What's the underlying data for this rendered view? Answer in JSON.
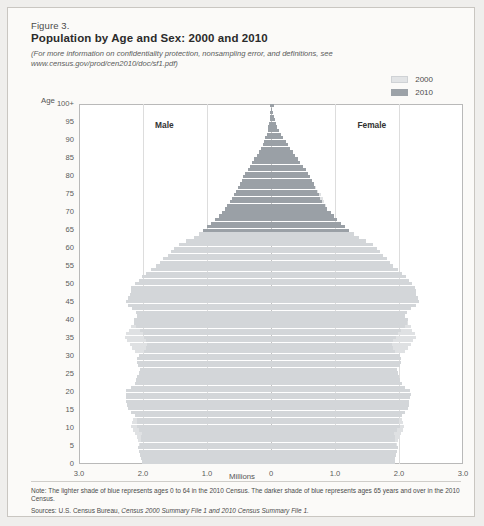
{
  "figure": {
    "number": "Figure 3.",
    "title": "Population by Age and Sex: 2000 and 2010",
    "subtitle_line1": "(For more information on confidentiality protection, nonsampling error, and definitions, see",
    "subtitle_line2": "www.census.gov/prod/cen2010/doc/sf1.pdf)"
  },
  "legend": {
    "items": [
      {
        "label": "2000",
        "color": "#e2e4e6"
      },
      {
        "label": "2010",
        "color": "#9ca2a8"
      }
    ]
  },
  "labels": {
    "age_axis": "Age",
    "x_axis": "Millions",
    "male": "Male",
    "female": "Female"
  },
  "notes": {
    "note": "Note: The lighter shade of blue represents ages 0 to 64 in the 2010 Census. The darker shade of blue represents ages 65 years and over in the 2010 Census.",
    "sources_prefix": "Sources: U.S. Census Bureau, ",
    "sources_italic": "Census 2000 Summary File 1 and 2010 Census Summary File 1."
  },
  "chart_data": {
    "type": "bar",
    "subtype": "population-pyramid",
    "title": "Population by Age and Sex: 2000 and 2010",
    "xlabel": "Millions",
    "ylabel": "Age",
    "xlim": [
      -3.0,
      3.0
    ],
    "ylim": [
      0,
      100
    ],
    "xtick_labels": [
      "3.0",
      "2.0",
      "1.0",
      "0",
      "1.0",
      "2.0",
      "3.0"
    ],
    "xtick_values": [
      -3.0,
      -2.0,
      -1.0,
      0,
      1.0,
      2.0,
      3.0
    ],
    "ytick_labels": [
      "100+",
      "95",
      "90",
      "85",
      "80",
      "75",
      "70",
      "65",
      "60",
      "55",
      "50",
      "45",
      "40",
      "35",
      "30",
      "25",
      "20",
      "15",
      "10",
      "5",
      "0"
    ],
    "ytick_values": [
      100,
      95,
      90,
      85,
      80,
      75,
      70,
      65,
      60,
      55,
      50,
      45,
      40,
      35,
      30,
      25,
      20,
      15,
      10,
      5,
      0
    ],
    "grid": true,
    "legend_position": "top-right",
    "dark_shade_threshold_age": 65,
    "ages": [
      0,
      1,
      2,
      3,
      4,
      5,
      6,
      7,
      8,
      9,
      10,
      11,
      12,
      13,
      14,
      15,
      16,
      17,
      18,
      19,
      20,
      21,
      22,
      23,
      24,
      25,
      26,
      27,
      28,
      29,
      30,
      31,
      32,
      33,
      34,
      35,
      36,
      37,
      38,
      39,
      40,
      41,
      42,
      43,
      44,
      45,
      46,
      47,
      48,
      49,
      50,
      51,
      52,
      53,
      54,
      55,
      56,
      57,
      58,
      59,
      60,
      61,
      62,
      63,
      64,
      65,
      66,
      67,
      68,
      69,
      70,
      71,
      72,
      73,
      74,
      75,
      76,
      77,
      78,
      79,
      80,
      81,
      82,
      83,
      84,
      85,
      86,
      87,
      88,
      89,
      90,
      91,
      92,
      93,
      94,
      95,
      96,
      97,
      98,
      99,
      100
    ],
    "series": [
      {
        "name": "Male 2010",
        "side": "left",
        "values": [
          2.02,
          2.03,
          2.04,
          2.06,
          2.08,
          2.05,
          2.03,
          2.03,
          2.01,
          2.06,
          2.1,
          2.09,
          2.09,
          2.13,
          2.19,
          2.24,
          2.25,
          2.26,
          2.27,
          2.27,
          2.26,
          2.18,
          2.13,
          2.11,
          2.09,
          2.06,
          2.04,
          2.08,
          2.1,
          2.1,
          2.07,
          1.99,
          1.95,
          1.93,
          1.95,
          1.99,
          2.0,
          2.05,
          2.11,
          2.14,
          2.14,
          2.09,
          2.11,
          2.17,
          2.24,
          2.27,
          2.24,
          2.21,
          2.19,
          2.18,
          2.13,
          2.07,
          2.02,
          1.95,
          1.87,
          1.8,
          1.74,
          1.68,
          1.61,
          1.56,
          1.51,
          1.43,
          1.33,
          1.21,
          1.13,
          1.06,
          1.0,
          0.94,
          0.87,
          0.82,
          0.77,
          0.72,
          0.68,
          0.64,
          0.61,
          0.58,
          0.55,
          0.52,
          0.49,
          0.46,
          0.43,
          0.4,
          0.36,
          0.33,
          0.29,
          0.26,
          0.22,
          0.19,
          0.16,
          0.13,
          0.11,
          0.09,
          0.07,
          0.05,
          0.04,
          0.03,
          0.02,
          0.015,
          0.01,
          0.007,
          0.02
        ]
      },
      {
        "name": "Female 2010",
        "side": "right",
        "values": [
          1.93,
          1.94,
          1.95,
          1.97,
          1.99,
          1.96,
          1.94,
          1.94,
          1.92,
          1.97,
          2.01,
          2.0,
          2.0,
          2.04,
          2.09,
          2.14,
          2.15,
          2.16,
          2.17,
          2.18,
          2.17,
          2.09,
          2.04,
          2.02,
          2.0,
          1.98,
          1.97,
          2.01,
          2.03,
          2.03,
          2.01,
          1.94,
          1.91,
          1.89,
          1.91,
          1.96,
          1.98,
          2.03,
          2.09,
          2.13,
          2.14,
          2.1,
          2.13,
          2.19,
          2.27,
          2.31,
          2.29,
          2.27,
          2.26,
          2.25,
          2.21,
          2.16,
          2.11,
          2.05,
          1.98,
          1.91,
          1.86,
          1.81,
          1.75,
          1.7,
          1.66,
          1.59,
          1.49,
          1.37,
          1.29,
          1.22,
          1.16,
          1.1,
          1.03,
          0.98,
          0.93,
          0.88,
          0.84,
          0.8,
          0.77,
          0.75,
          0.72,
          0.69,
          0.67,
          0.64,
          0.61,
          0.58,
          0.54,
          0.5,
          0.46,
          0.42,
          0.38,
          0.34,
          0.3,
          0.26,
          0.23,
          0.19,
          0.16,
          0.13,
          0.1,
          0.08,
          0.06,
          0.045,
          0.03,
          0.02,
          0.05
        ]
      },
      {
        "name": "Male 2000",
        "side": "left",
        "values": [
          1.95,
          1.98,
          2.0,
          2.02,
          2.05,
          2.06,
          2.08,
          2.1,
          2.13,
          2.16,
          2.18,
          2.17,
          2.15,
          2.13,
          2.1,
          2.06,
          2.03,
          2.0,
          1.98,
          1.98,
          1.97,
          1.93,
          1.89,
          1.86,
          1.84,
          1.82,
          1.84,
          1.88,
          1.92,
          1.99,
          2.06,
          2.12,
          2.17,
          2.21,
          2.25,
          2.28,
          2.26,
          2.22,
          2.18,
          2.14,
          2.1,
          2.04,
          1.99,
          1.94,
          1.88,
          1.82,
          1.75,
          1.69,
          1.63,
          1.58,
          1.52,
          1.44,
          1.37,
          1.31,
          1.25,
          1.2,
          1.14,
          1.06,
          0.99,
          0.95,
          0.92,
          0.89,
          0.86,
          0.84,
          0.82,
          0.8,
          0.78,
          0.76,
          0.74,
          0.72,
          0.7,
          0.68,
          0.65,
          0.62,
          0.59,
          0.56,
          0.52,
          0.48,
          0.44,
          0.4,
          0.36,
          0.32,
          0.28,
          0.24,
          0.2,
          0.17,
          0.14,
          0.11,
          0.09,
          0.07,
          0.05,
          0.04,
          0.03,
          0.02,
          0.015,
          0.01,
          0.008,
          0.006,
          0.004,
          0.003,
          0.012
        ]
      },
      {
        "name": "Female 2000",
        "side": "right",
        "values": [
          1.86,
          1.89,
          1.91,
          1.93,
          1.96,
          1.97,
          1.99,
          2.01,
          2.03,
          2.06,
          2.08,
          2.07,
          2.05,
          2.03,
          2.0,
          1.96,
          1.93,
          1.91,
          1.89,
          1.9,
          1.9,
          1.86,
          1.83,
          1.8,
          1.78,
          1.77,
          1.79,
          1.83,
          1.88,
          1.95,
          2.02,
          2.09,
          2.14,
          2.18,
          2.22,
          2.26,
          2.25,
          2.21,
          2.18,
          2.14,
          2.11,
          2.05,
          2.01,
          1.96,
          1.91,
          1.86,
          1.79,
          1.73,
          1.68,
          1.63,
          1.58,
          1.5,
          1.44,
          1.38,
          1.33,
          1.28,
          1.23,
          1.15,
          1.09,
          1.05,
          1.03,
          1.01,
          0.99,
          0.98,
          0.96,
          0.95,
          0.94,
          0.92,
          0.91,
          0.9,
          0.89,
          0.88,
          0.86,
          0.83,
          0.81,
          0.78,
          0.74,
          0.7,
          0.66,
          0.62,
          0.58,
          0.53,
          0.48,
          0.43,
          0.38,
          0.34,
          0.29,
          0.25,
          0.21,
          0.17,
          0.14,
          0.11,
          0.09,
          0.07,
          0.05,
          0.04,
          0.028,
          0.02,
          0.014,
          0.01,
          0.03
        ]
      }
    ]
  }
}
